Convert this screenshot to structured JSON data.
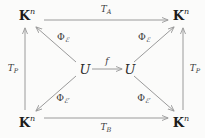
{
  "diagram": {
    "type": "commutative-diagram",
    "background_color": "#fbfbfa",
    "line_color": "#9a9a9a",
    "text_color": "#1c1c1c",
    "objects": {
      "corner_top_left": {
        "symbol": "K",
        "superscript": "n"
      },
      "corner_top_right": {
        "symbol": "K",
        "superscript": "n"
      },
      "corner_bottom_left": {
        "symbol": "K",
        "superscript": "n"
      },
      "corner_bottom_right": {
        "symbol": "K",
        "superscript": "n"
      },
      "center_left": {
        "symbol": "U"
      },
      "center_right": {
        "symbol": "U"
      }
    },
    "edges": {
      "top": {
        "label_base": "T",
        "label_sub": "A",
        "direction": "left-to-right"
      },
      "bottom": {
        "label_base": "T",
        "label_sub": "B",
        "direction": "left-to-right"
      },
      "left": {
        "label_base": "T",
        "label_sub": "P",
        "direction": "upward"
      },
      "right": {
        "label_base": "T",
        "label_sub": "P",
        "direction": "upward"
      },
      "center": {
        "label_base": "f",
        "direction": "left-to-right"
      },
      "diag_up_left": {
        "phi": "Φ",
        "sub": "ℰ",
        "prime": "",
        "direction": "up-left"
      },
      "diag_up_right": {
        "phi": "Φ",
        "sub": "ℰ",
        "prime": "",
        "direction": "up-right"
      },
      "diag_down_left": {
        "phi": "Φ",
        "sub": "ℰ",
        "prime": "′",
        "direction": "down-left"
      },
      "diag_down_right": {
        "phi": "Φ",
        "sub": "ℰ",
        "prime": "′",
        "direction": "down-right"
      }
    }
  }
}
